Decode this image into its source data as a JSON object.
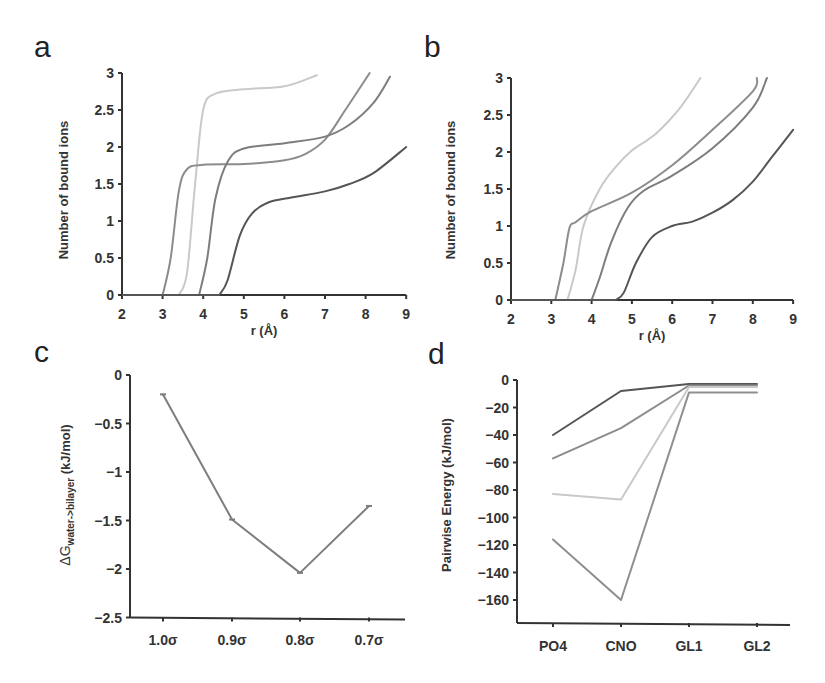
{
  "colors": {
    "light": "#c9c9c9",
    "mid": "#8c8c8c",
    "mid2": "#7d7d7d",
    "dark": "#555555",
    "axis": "#333333"
  },
  "chart_data": [
    {
      "panel": "a",
      "type": "line",
      "xlabel": "r (Å)",
      "ylabel": "Number of bound ions",
      "xlim": [
        2,
        9
      ],
      "ylim": [
        0,
        3
      ],
      "xticks": [
        "2",
        "3",
        "4",
        "5",
        "6",
        "7",
        "8",
        "9"
      ],
      "yticks": [
        "0",
        "0.5",
        "1",
        "1.5",
        "2",
        "2.5",
        "3"
      ],
      "grid": false,
      "series": [
        {
          "name": "light",
          "color": "#c9c9c9",
          "points": [
            [
              3.4,
              0
            ],
            [
              3.6,
              0.3
            ],
            [
              3.8,
              1.5
            ],
            [
              4.0,
              2.5
            ],
            [
              4.3,
              2.72
            ],
            [
              5.0,
              2.78
            ],
            [
              6.0,
              2.82
            ],
            [
              6.8,
              2.97
            ]
          ]
        },
        {
          "name": "mid",
          "color": "#8c8c8c",
          "points": [
            [
              3.0,
              0
            ],
            [
              3.2,
              0.5
            ],
            [
              3.4,
              1.4
            ],
            [
              3.6,
              1.7
            ],
            [
              4.0,
              1.76
            ],
            [
              5.0,
              1.77
            ],
            [
              6.0,
              1.82
            ],
            [
              6.5,
              1.9
            ],
            [
              7.0,
              2.1
            ],
            [
              7.5,
              2.5
            ],
            [
              8.1,
              3.0
            ]
          ]
        },
        {
          "name": "mid2",
          "color": "#7d7d7d",
          "points": [
            [
              3.9,
              0
            ],
            [
              4.1,
              0.5
            ],
            [
              4.3,
              1.3
            ],
            [
              4.6,
              1.8
            ],
            [
              5.0,
              1.98
            ],
            [
              6.0,
              2.05
            ],
            [
              7.0,
              2.14
            ],
            [
              7.6,
              2.3
            ],
            [
              8.2,
              2.6
            ],
            [
              8.6,
              2.95
            ]
          ]
        },
        {
          "name": "dark",
          "color": "#555555",
          "points": [
            [
              4.4,
              0
            ],
            [
              4.6,
              0.2
            ],
            [
              4.9,
              0.8
            ],
            [
              5.2,
              1.1
            ],
            [
              5.6,
              1.25
            ],
            [
              6.2,
              1.32
            ],
            [
              7.0,
              1.4
            ],
            [
              7.6,
              1.5
            ],
            [
              8.2,
              1.65
            ],
            [
              9.0,
              2.0
            ]
          ]
        }
      ]
    },
    {
      "panel": "b",
      "type": "line",
      "xlabel": "r (Å)",
      "ylabel": "Number of bound ions",
      "xlim": [
        2,
        9
      ],
      "ylim": [
        0,
        3
      ],
      "xticks": [
        "2",
        "3",
        "4",
        "5",
        "6",
        "7",
        "8",
        "9"
      ],
      "yticks": [
        "0",
        "0.5",
        "1",
        "1.5",
        "2",
        "2.5",
        "3"
      ],
      "grid": false,
      "series": [
        {
          "name": "light",
          "color": "#c9c9c9",
          "points": [
            [
              3.4,
              0
            ],
            [
              3.6,
              0.4
            ],
            [
              3.8,
              1.0
            ],
            [
              4.2,
              1.5
            ],
            [
              4.6,
              1.8
            ],
            [
              5.0,
              2.02
            ],
            [
              5.6,
              2.25
            ],
            [
              6.2,
              2.6
            ],
            [
              6.7,
              3.0
            ]
          ]
        },
        {
          "name": "mid",
          "color": "#8c8c8c",
          "points": [
            [
              3.1,
              0
            ],
            [
              3.3,
              0.5
            ],
            [
              3.45,
              0.97
            ],
            [
              3.6,
              1.05
            ],
            [
              4.0,
              1.2
            ],
            [
              5.0,
              1.45
            ],
            [
              6.0,
              1.82
            ],
            [
              7.0,
              2.3
            ],
            [
              8.0,
              2.82
            ],
            [
              8.1,
              3.0
            ]
          ]
        },
        {
          "name": "mid2",
          "color": "#7d7d7d",
          "points": [
            [
              4.0,
              0
            ],
            [
              4.2,
              0.3
            ],
            [
              4.5,
              0.8
            ],
            [
              4.9,
              1.25
            ],
            [
              5.3,
              1.48
            ],
            [
              6.0,
              1.68
            ],
            [
              7.0,
              2.05
            ],
            [
              8.0,
              2.6
            ],
            [
              8.35,
              3.0
            ]
          ]
        },
        {
          "name": "dark",
          "color": "#555555",
          "points": [
            [
              4.6,
              0
            ],
            [
              4.8,
              0.1
            ],
            [
              5.1,
              0.5
            ],
            [
              5.5,
              0.85
            ],
            [
              6.0,
              1.0
            ],
            [
              6.5,
              1.06
            ],
            [
              7.0,
              1.18
            ],
            [
              7.5,
              1.35
            ],
            [
              8.0,
              1.6
            ],
            [
              8.5,
              1.95
            ],
            [
              9.0,
              2.3
            ]
          ]
        }
      ]
    },
    {
      "panel": "c",
      "type": "line",
      "xlabel": "",
      "ylabel_main": "ΔG",
      "ylabel_sub": "water->bilayer",
      "ylabel_unit": "(kJ/mol)",
      "categories": [
        "1.0σ",
        "0.9σ",
        "0.8σ",
        "0.7σ"
      ],
      "values": [
        -0.2,
        -1.49,
        -2.04,
        -1.35
      ],
      "ylim": [
        -2.5,
        0
      ],
      "yticks": [
        "0",
        "-0.5",
        "-1",
        "-1.5",
        "-2",
        "-2.5"
      ],
      "grid": false,
      "color": "#7d7d7d"
    },
    {
      "panel": "d",
      "type": "line",
      "xlabel": "",
      "ylabel": "Pairwise Energy (kJ/mol)",
      "categories": [
        "PO4",
        "CNO",
        "GL1",
        "GL2"
      ],
      "ylim": [
        -175,
        0
      ],
      "yticks": [
        "0",
        "-20",
        "-40",
        "-60",
        "-80",
        "-100",
        "-120",
        "-140",
        "-160"
      ],
      "grid": false,
      "series": [
        {
          "name": "dark",
          "color": "#555555",
          "values": [
            -40,
            -8,
            -3,
            -3
          ]
        },
        {
          "name": "mid",
          "color": "#8c8c8c",
          "values": [
            -57,
            -35,
            -4,
            -4
          ]
        },
        {
          "name": "light",
          "color": "#c9c9c9",
          "values": [
            -83,
            -87,
            -5,
            -5
          ]
        },
        {
          "name": "mid2",
          "color": "#8f8f8f",
          "values": [
            -116,
            -160,
            -9,
            -9
          ]
        }
      ]
    }
  ],
  "panels": {
    "a": {
      "letter": "a",
      "xlabel": "r (Å)",
      "ylabel": "Number of bound ions"
    },
    "b": {
      "letter": "b",
      "xlabel": "r (Å)",
      "ylabel": "Number of bound ions"
    },
    "c": {
      "letter": "c",
      "ylabel_main": "ΔG",
      "ylabel_sub": "water->bilayer",
      "ylabel_unit": " (kJ/mol)"
    },
    "d": {
      "letter": "d",
      "ylabel": "Pairwise Energy (kJ/mol)"
    }
  }
}
